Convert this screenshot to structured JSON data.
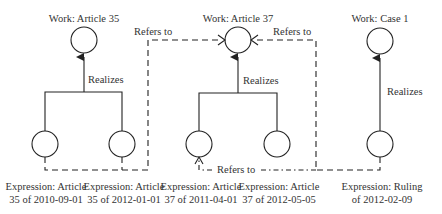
{
  "works": [
    {
      "label": "Work: Article 35"
    },
    {
      "label": "Work: Article 37"
    },
    {
      "label": "Work: Case 1"
    }
  ],
  "realizes": [
    "Realizes",
    "Realizes",
    "Realizes"
  ],
  "refers_to": [
    "Refers to",
    "Refers to",
    "Refers to"
  ],
  "expressions": [
    {
      "line1": "Expression: Article",
      "line2": "35 of 2010-09-01"
    },
    {
      "line1": "Expression: Article",
      "line2": "35 of 2012-01-01"
    },
    {
      "line1": "Expression: Article",
      "line2": "37 of 2011-04-01"
    },
    {
      "line1": "Expression: Article",
      "line2": "37 of 2012-05-05"
    },
    {
      "line1": "Expression: Ruling",
      "line2": "of 2012-02-09"
    }
  ],
  "colors": {
    "line": "#222222",
    "text": "#333333"
  }
}
